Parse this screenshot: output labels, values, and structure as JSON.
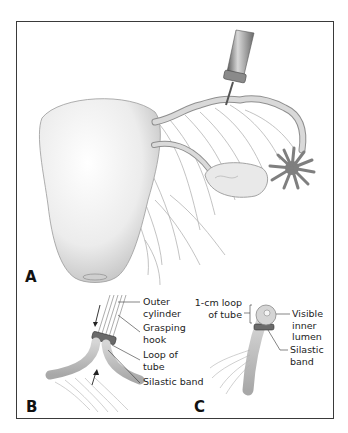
{
  "figure": {
    "panels": [
      {
        "id": "A",
        "label": "A",
        "content": "Uterus with fallopian tubes, ovary and fimbriae; applicator grasping the tube",
        "annotations": []
      },
      {
        "id": "B",
        "label": "B",
        "annotations": [
          {
            "text_line1": "Outer",
            "text_line2": "cylinder"
          },
          {
            "text_line1": "Grasping",
            "text_line2": "hook"
          },
          {
            "text_line1": "Loop of",
            "text_line2": "tube"
          },
          {
            "text_line1": "Silastic band",
            "text_line2": ""
          }
        ]
      },
      {
        "id": "C",
        "label": "C",
        "annotations": [
          {
            "text_line1": "1-cm loop",
            "text_line2": "of tube"
          },
          {
            "text_line1": "Visible",
            "text_line2": "inner",
            "text_line3": "lumen"
          },
          {
            "text_line1": "Silastic",
            "text_line2": "band"
          }
        ]
      }
    ]
  },
  "colors": {
    "frame": "#3a3a3a",
    "tissue_light": "#e6e6e6",
    "tissue_mid": "#bdbdbd",
    "fimbriae": "#7d7d7d",
    "instrument": "#8a8a8a",
    "line": "#9a9a9a"
  }
}
